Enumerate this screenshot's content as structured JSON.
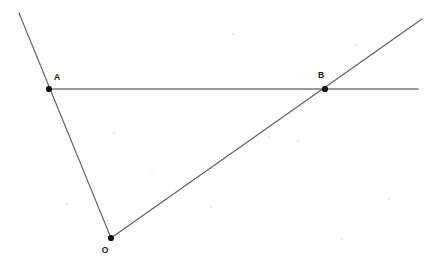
{
  "diagram": {
    "canvas": {
      "width": 440,
      "height": 266,
      "background": "#ffffff"
    },
    "style": {
      "ray_color": "#5d5d5d",
      "line_color": "#7b7b7b",
      "point_color": "#121212",
      "label_color": "#1a1a1a",
      "ray_width": 1.1,
      "line_width": 1.6,
      "point_radius": 3.1
    },
    "points": [
      {
        "id": "A",
        "label": "A",
        "x": 49,
        "y": 89,
        "label_x": 57,
        "label_y": 80
      },
      {
        "id": "B",
        "label": "B",
        "x": 325,
        "y": 89,
        "label_x": 321,
        "label_y": 78
      },
      {
        "id": "O",
        "label": "O",
        "x": 111,
        "y": 238,
        "label_x": 105,
        "label_y": 253
      }
    ],
    "segments": [
      {
        "id": "ray-oa",
        "name": "ray-through-O-and-A",
        "x1": 111,
        "y1": 238,
        "x2": 19,
        "y2": 13,
        "color": "#5d5d5d",
        "width": 1.1
      },
      {
        "id": "ray-ob",
        "name": "ray-through-O-and-B",
        "x1": 111,
        "y1": 238,
        "x2": 422,
        "y2": 19,
        "color": "#5d5d5d",
        "width": 1.1
      },
      {
        "id": "line-ab",
        "name": "horizontal-line-A-to-B",
        "x1": 49,
        "y1": 89,
        "x2": 418,
        "y2": 89,
        "color": "#7b7b7b",
        "width": 1.6
      }
    ],
    "speckles": [
      {
        "x": 232,
        "y": 33,
        "size": 2
      },
      {
        "x": 355,
        "y": 44,
        "size": 2
      },
      {
        "x": 113,
        "y": 132,
        "size": 2
      },
      {
        "x": 297,
        "y": 140,
        "size": 2
      },
      {
        "x": 151,
        "y": 172,
        "size": 2
      },
      {
        "x": 210,
        "y": 206,
        "size": 2
      },
      {
        "x": 268,
        "y": 136,
        "size": 2
      },
      {
        "x": 388,
        "y": 198,
        "size": 2
      },
      {
        "x": 66,
        "y": 203,
        "size": 2
      },
      {
        "x": 341,
        "y": 238,
        "size": 2
      }
    ]
  }
}
